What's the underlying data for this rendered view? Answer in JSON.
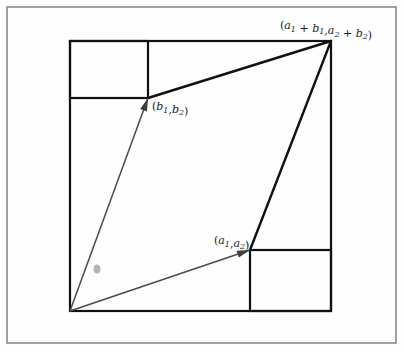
{
  "figure": {
    "background_color": "#fefefe",
    "frame": {
      "name": "outer-frame",
      "color": "#8a8a8a",
      "x": 7,
      "y": 7,
      "width": 389,
      "height": 336
    },
    "square": {
      "name": "bounding-square",
      "color": "#111111",
      "x": 70,
      "y": 41,
      "width": 261,
      "height": 270
    },
    "inner_rectangles": [
      {
        "name": "top-left-rectangle",
        "x": 70,
        "y": 41,
        "width": 78,
        "height": 57
      },
      {
        "name": "bottom-right-rectangle",
        "x": 250,
        "y": 250,
        "width": 81,
        "height": 61
      }
    ],
    "origin": {
      "x": 70,
      "y": 311
    },
    "vectors": [
      {
        "name": "vector-b",
        "label": "(b₁,b₂)",
        "label_plain": "(b1,b2)",
        "from": {
          "x": 70,
          "y": 311
        },
        "to": {
          "x": 148,
          "y": 98
        },
        "color": "#4a4a4a",
        "label_x": 152,
        "label_y": 110
      },
      {
        "name": "vector-a",
        "label": "(a₁,a₂)",
        "label_plain": "(a1,a2)",
        "from": {
          "x": 70,
          "y": 311
        },
        "to": {
          "x": 250,
          "y": 250
        },
        "color": "#4a4a4a",
        "label_x": 214,
        "label_y": 244
      }
    ],
    "sum_point": {
      "name": "vector-sum-point",
      "label": "(a₁ + b₁,a₂ + b₂)",
      "label_plain": "(a1 + b1,a2 + b2)",
      "x": 331,
      "y": 41,
      "label_x": 280,
      "label_y": 29
    },
    "parallelogram_edges": [
      {
        "name": "edge-b-to-sum",
        "from": {
          "x": 148,
          "y": 98
        },
        "to": {
          "x": 331,
          "y": 41
        },
        "color": "#111111"
      },
      {
        "name": "edge-sum-to-a",
        "from": {
          "x": 331,
          "y": 41
        },
        "to": {
          "x": 250,
          "y": 250
        },
        "color": "#111111"
      }
    ],
    "smudge": {
      "name": "ink-smudge",
      "x": 97,
      "y": 269,
      "rx": 3.4,
      "ry": 4.6,
      "color": "#9a9a9a"
    }
  },
  "chart_data": {
    "type": "diagram",
    "points": [
      {
        "name": "origin",
        "label": "",
        "x": 0,
        "y": 0
      },
      {
        "name": "a",
        "label": "(a₁,a₂)",
        "x": 180,
        "y": 61
      },
      {
        "name": "b",
        "label": "(b₁,b₂)",
        "x": 78,
        "y": 213
      },
      {
        "name": "a_plus_b",
        "label": "(a₁ + b₁,a₂ + b₂)",
        "x": 261,
        "y": 270
      }
    ],
    "annotations": [
      "(a₁ + b₁,a₂ + b₂)",
      "(b₁,b₂)",
      "(a₁,a₂)"
    ]
  }
}
